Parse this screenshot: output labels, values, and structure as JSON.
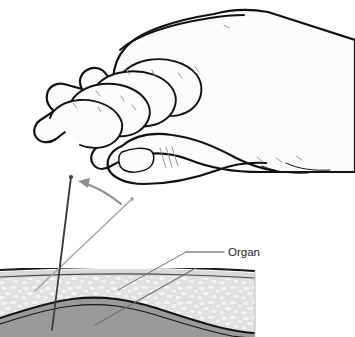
{
  "figure": {
    "type": "medical-line-illustration",
    "background_color": "#ffffff",
    "width": 355,
    "height": 337
  },
  "labels": {
    "organ": "Organ",
    "caption_fragment": ""
  },
  "colors": {
    "ink_black": "#111111",
    "hand_fill": "#fbfbfb",
    "hand_outline": "#111111",
    "hand_crease": "#8a8a8a",
    "needle_dark": "#3a3a3a",
    "needle_light": "#a8a8a8",
    "arrow_gray": "#8f8f8f",
    "skin_line": "#1a1a1a",
    "epidermis_fill": "#d9d9d9",
    "subcutaneous_fill": "#e3e3e3",
    "stipple_light": "#f4f4f4",
    "stipple_edge": "#c3c3c3",
    "organ_fill": "#9a9a9a",
    "organ_outline": "#141414",
    "leader_line": "#6d6d6d",
    "label_text": "#232323"
  },
  "elements": {
    "hand": {
      "name": "hand",
      "description": "Line drawing of a right hand, fingers curled, thumb extended below, wrist exiting right edge",
      "finger_count": 4,
      "has_thumbnail": true,
      "knuckle_crease_count": 3
    },
    "needle_vertical": {
      "name": "needle-vertical",
      "description": "Dark needle inserted near-vertically through skin into organ",
      "tip_top": [
        71,
        177
      ],
      "entry_point": [
        58,
        272
      ],
      "tip_bottom": [
        52,
        330
      ],
      "color": "#3a3a3a",
      "stroke_width": 1.9
    },
    "needle_angled": {
      "name": "needle-angled",
      "description": "Light gray needle shown at an oblique angle, pre-rotation position",
      "tip_top": [
        132,
        199
      ],
      "entry_point": [
        58,
        272
      ],
      "tip_bottom": [
        35,
        291
      ],
      "color": "#a8a8a8",
      "stroke_width": 1.6
    },
    "rotation_arrow": {
      "name": "rotation-arrow",
      "description": "Curved arrow indicating the needle is rotated from the oblique to the vertical position",
      "direction": "right-to-left",
      "color": "#8f8f8f"
    },
    "tissue_block": {
      "name": "tissue-cross-section",
      "left": 0,
      "right": 255,
      "top": 268,
      "bottom": 337,
      "layers": [
        {
          "name": "skin-surface-line",
          "fill": "#ffffff",
          "outline": "#1a1a1a"
        },
        {
          "name": "epidermis-band",
          "fill": "#d9d9d9"
        },
        {
          "name": "subcutaneous-stippled-layer",
          "fill": "#e3e3e3",
          "texture": "stipple"
        },
        {
          "name": "organ-layer",
          "fill": "#9a9a9a",
          "outline": "#141414"
        }
      ]
    },
    "organ_leader": {
      "name": "organ-leader-line",
      "description": "Leader line running from the Organ text label down-left into the organ layer",
      "from": [
        224,
        252
      ],
      "to": [
        95,
        325
      ],
      "color": "#6d6d6d"
    }
  }
}
